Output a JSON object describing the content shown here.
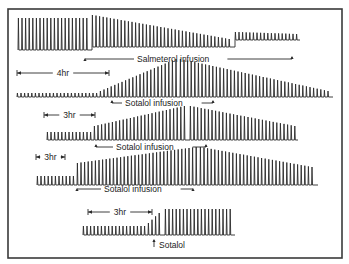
{
  "figure": {
    "frame": {
      "x": 8,
      "y": 9,
      "w": 334,
      "h": 249
    },
    "stroke_color": "#2a2a2a",
    "panels": [
      {
        "id": "salmeterol",
        "baseline_y": 50,
        "x_start": 18,
        "x_end": 300,
        "beat_spacing": 3.6,
        "segments": [
          {
            "x0": 18,
            "x1": 92,
            "amp_start": 32,
            "amp_end": 32
          },
          {
            "x0": 92,
            "x1": 235,
            "amp_start": 32,
            "amp_end": 8,
            "baseline_shift": -3
          },
          {
            "x0": 235,
            "x1": 300,
            "amp_start": 8,
            "amp_end": 6,
            "baseline_shift": -10
          }
        ],
        "label": "Salmeterol infusion",
        "label_x": 137,
        "label_y": 62,
        "arrow_left": {
          "x": 85,
          "y": 59
        },
        "arrow_right": {
          "x": 292,
          "y": 57
        },
        "bracket": {
          "x0": 17,
          "x1": 109,
          "y": 73,
          "label": "4hr"
        }
      },
      {
        "id": "sotalol-1",
        "baseline_y": 97,
        "x_start": 17,
        "x_end": 333,
        "beat_spacing": 3.6,
        "segments": [
          {
            "x0": 17,
            "x1": 100,
            "amp_start": 4,
            "amp_end": 4
          },
          {
            "x0": 100,
            "x1": 180,
            "amp_start": 6,
            "amp_end": 38
          },
          {
            "x0": 180,
            "x1": 333,
            "amp_start": 38,
            "amp_end": 6
          }
        ],
        "label": "Sotalol infusion",
        "label_x": 125,
        "label_y": 106,
        "arrow_left": {
          "x": 112,
          "y": 101
        },
        "arrow_right": {
          "x": 213,
          "y": 101
        }
      },
      {
        "id": "sotalol-2",
        "baseline_y": 140,
        "x_start": 47,
        "x_end": 298,
        "beat_spacing": 3.6,
        "segments": [
          {
            "x0": 47,
            "x1": 94,
            "amp_start": 8,
            "amp_end": 8
          },
          {
            "x0": 94,
            "x1": 190,
            "amp_start": 14,
            "amp_end": 34
          },
          {
            "x0": 190,
            "x1": 298,
            "amp_start": 34,
            "amp_end": 14
          }
        ],
        "label": "Sotalol infusion",
        "label_x": 116,
        "label_y": 150,
        "arrow_left": {
          "x": 96,
          "y": 145
        },
        "arrow_right": {
          "x": 206,
          "y": 145
        },
        "bracket": {
          "x0": 44,
          "x1": 95,
          "y": 115,
          "label": "3hr"
        }
      },
      {
        "id": "sotalol-3",
        "baseline_y": 185,
        "x_start": 37,
        "x_end": 318,
        "beat_spacing": 3.6,
        "segments": [
          {
            "x0": 37,
            "x1": 77,
            "amp_start": 9,
            "amp_end": 9
          },
          {
            "x0": 77,
            "x1": 200,
            "amp_start": 22,
            "amp_end": 38
          },
          {
            "x0": 200,
            "x1": 318,
            "amp_start": 38,
            "amp_end": 18
          }
        ],
        "label": "Sotalol infusion",
        "label_x": 104,
        "label_y": 192,
        "arrow_left": {
          "x": 77,
          "y": 189
        },
        "arrow_right": {
          "x": 193,
          "y": 189
        },
        "bracket": {
          "x0": 36,
          "x1": 65,
          "y": 157,
          "label": "3hr"
        }
      },
      {
        "id": "sotalol-4",
        "baseline_y": 235,
        "x_start": 83,
        "x_end": 235,
        "beat_spacing": 3.6,
        "segments": [
          {
            "x0": 83,
            "x1": 148,
            "amp_start": 9,
            "amp_end": 9
          },
          {
            "x0": 148,
            "x1": 165,
            "amp_start": 12,
            "amp_end": 22
          },
          {
            "x0": 165,
            "x1": 235,
            "amp_start": 26,
            "amp_end": 26
          }
        ],
        "label": "Sotalol",
        "label_x": 159,
        "label_y": 248,
        "arrow_up": {
          "x": 154,
          "y": 240
        },
        "bracket": {
          "x0": 88,
          "x1": 152,
          "y": 212,
          "label": "3hr"
        }
      }
    ]
  }
}
